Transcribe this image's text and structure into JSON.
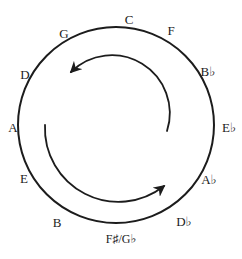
{
  "figure": {
    "background_color": "#ffffff",
    "line_color": "#1c1c1c"
  },
  "notes": [
    {
      "label": "C"
    },
    {
      "label": "F"
    },
    {
      "label": "B♭"
    },
    {
      "label": "E♭"
    },
    {
      "label": "A♭"
    },
    {
      "label": "D♭"
    },
    {
      "label": "F♯/G♭"
    },
    {
      "label": "B"
    },
    {
      "label": "E"
    },
    {
      "label": "A"
    },
    {
      "label": "D"
    },
    {
      "label": "G"
    }
  ],
  "arrows": [
    {
      "icon": "curved-arrow-counterclockwise-top"
    },
    {
      "icon": "curved-arrow-counterclockwise-bottom"
    }
  ]
}
